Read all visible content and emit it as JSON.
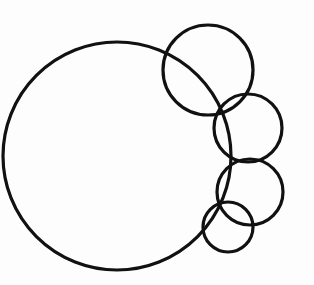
{
  "figure": {
    "background_color": "#fdfdfd",
    "stroke_color": "#111111",
    "canvas_width": 314,
    "canvas_height": 285,
    "shape_count": "5"
  },
  "chart_data": {
    "type": "scatter",
    "xlabel": "",
    "ylabel": "",
    "xlim": [
      0,
      314
    ],
    "ylim": [
      0,
      285
    ],
    "grid": false,
    "legend": "none",
    "units": "pixels",
    "shapes": [
      {
        "name": "large-circle",
        "label": "Large circle",
        "cx": 117,
        "cy": 156,
        "r": 114,
        "stroke_width": 3.2,
        "stroke": "#111111",
        "fill": "none"
      },
      {
        "name": "circle-2",
        "label": "Upper-right circle",
        "cx": 208,
        "cy": 70,
        "r": 45,
        "stroke_width": 3.2,
        "stroke": "#111111",
        "fill": "none"
      },
      {
        "name": "circle-3",
        "label": "Right circle",
        "cx": 248,
        "cy": 128,
        "r": 34,
        "stroke_width": 3.2,
        "stroke": "#111111",
        "fill": "none"
      },
      {
        "name": "circle-4",
        "label": "Lower-right circle",
        "cx": 250,
        "cy": 192,
        "r": 33,
        "stroke_width": 3.2,
        "stroke": "#111111",
        "fill": "none"
      },
      {
        "name": "circle-5",
        "label": "Small bottom circle",
        "cx": 228,
        "cy": 227,
        "r": 25,
        "stroke_width": 3.2,
        "stroke": "#111111",
        "fill": "none"
      }
    ]
  }
}
